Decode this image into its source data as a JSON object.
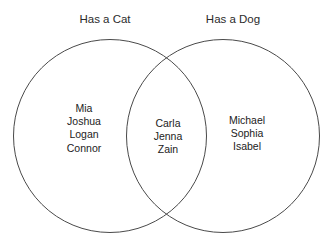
{
  "diagram": {
    "type": "venn",
    "top_clipped_text": "··· ··· ·· ··· ·· ·········",
    "left_set": {
      "label": "Has a Cat",
      "members": [
        "Mia",
        "Joshua",
        "Logan",
        "Connor"
      ]
    },
    "right_set": {
      "label": "Has a Dog",
      "members": [
        "Michael",
        "Sophia",
        "Isabel"
      ]
    },
    "intersection": {
      "members": [
        "Carla",
        "Jenna",
        "Zain"
      ]
    },
    "style": {
      "background": "#ffffff",
      "stroke": "#4a4a4a",
      "text": "#222222"
    }
  }
}
